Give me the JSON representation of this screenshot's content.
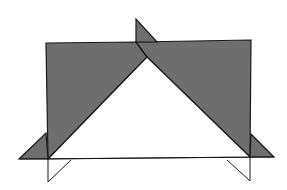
{
  "diagram": {
    "type": "geometric-figure",
    "colors": {
      "background": "#ffffff",
      "shade": "#6e6e6e",
      "stroke": "#1a1a1a",
      "white_region": "#ffffff"
    },
    "shapes": {
      "left_plane": [
        [
          46,
          43
        ],
        [
          136,
          42
        ],
        [
          147,
          57
        ],
        [
          48,
          159
        ]
      ],
      "right_plane": [
        [
          136,
          42
        ],
        [
          251,
          40
        ],
        [
          250,
          157
        ],
        [
          147,
          57
        ]
      ],
      "white_triangle": [
        [
          147,
          57
        ],
        [
          48,
          159
        ],
        [
          250,
          157
        ]
      ],
      "top_flap": [
        [
          136,
          19
        ],
        [
          136,
          42
        ],
        [
          157,
          42
        ]
      ],
      "left_flap": [
        [
          19,
          159
        ],
        [
          46,
          133
        ],
        [
          48,
          159
        ]
      ],
      "right_flap": [
        [
          251,
          134
        ],
        [
          274,
          157
        ],
        [
          250,
          157
        ]
      ],
      "baseline": [
        [
          19,
          159
        ],
        [
          274,
          157
        ]
      ],
      "left_support": [
        [
          48,
          159
        ],
        [
          48,
          182
        ],
        [
          71,
          160
        ]
      ],
      "right_support": [
        [
          250,
          158
        ],
        [
          250,
          181
        ],
        [
          227,
          160
        ]
      ]
    }
  }
}
